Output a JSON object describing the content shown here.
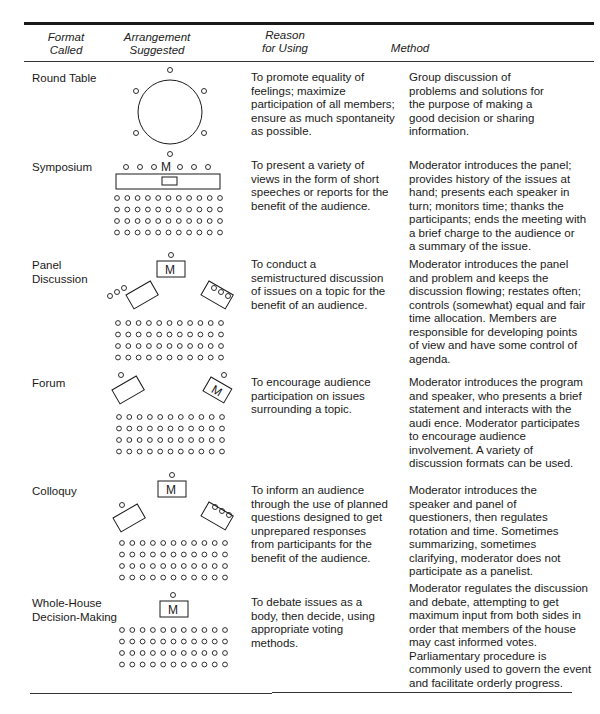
{
  "headers": {
    "format": [
      "Format",
      "Called"
    ],
    "arrangement": [
      "Arrangement",
      "Suggested"
    ],
    "reason": [
      "Reason",
      "for Using"
    ],
    "method": [
      "Method"
    ]
  },
  "moderator_label": "M",
  "rows": [
    {
      "format": [
        "Round Table"
      ],
      "reason": [
        "To promote equality of",
        "feelings; maximize",
        "participation of all members;",
        "ensure as much spontaneity",
        "as possible."
      ],
      "method": [
        "Group discussion of",
        "problems and solutions for",
        "the purpose of making a",
        "good decision or sharing",
        "information."
      ]
    },
    {
      "format": [
        "Symposium"
      ],
      "reason": [
        "To present a variety of",
        "views in the form of short",
        "speeches or reports for the",
        "benefit of the audience."
      ],
      "method": [
        "Moderator introduces the panel;",
        "provides history of the issues at",
        "hand; presents each speaker in",
        "turn; monitors time; thanks the",
        "participants; ends the meeting with",
        "a brief charge to the audience or",
        "a summary of the issue."
      ]
    },
    {
      "format": [
        "Panel",
        "Discussion"
      ],
      "reason": [
        "To conduct a",
        "semistructured discussion",
        "of issues on a topic for the",
        "benefit of an audience."
      ],
      "method": [
        "Moderator introduces the panel",
        "and problem and keeps the",
        "discussion flowing; restates often;",
        "controls (somewhat) equal and fair",
        "time allocation. Members are",
        "responsible for developing points",
        "of view and have some control of",
        "agenda."
      ]
    },
    {
      "format": [
        "Forum"
      ],
      "reason": [
        "To encourage audience",
        "participation on issues",
        "surrounding a topic."
      ],
      "method": [
        "Moderator introduces the program",
        "and speaker, who presents a brief",
        "statement and interacts with the",
        "audi ence. Moderator participates",
        "to encourage audience",
        "involvement. A variety of",
        "discussion formats can be used."
      ]
    },
    {
      "format": [
        "Colloquy"
      ],
      "reason": [
        "To inform an audience",
        "through the use of planned",
        "questions designed to get",
        "unprepared responses",
        "from participants for the",
        "benefit of the audience."
      ],
      "method": [
        "Moderator introduces the",
        "speaker and panel of",
        "questioners, then regulates",
        "rotation and time. Sometimes",
        "summarizing, sometimes",
        "clarifying, moderator does not",
        "participate as a panelist."
      ]
    },
    {
      "format": [
        "Whole-House",
        "Decision-Making"
      ],
      "reason": [
        "To debate issues as a",
        "body, then decide, using",
        "appropriate voting",
        "methods."
      ],
      "method": [
        "Moderator regulates the discussion",
        "and debate, attempting to get",
        "maximum input from both sides in",
        "order that members of the house",
        "may cast informed votes.",
        "Parliamentary procedure is",
        "commonly used to govern the event",
        "and facilitate orderly progress."
      ]
    }
  ]
}
